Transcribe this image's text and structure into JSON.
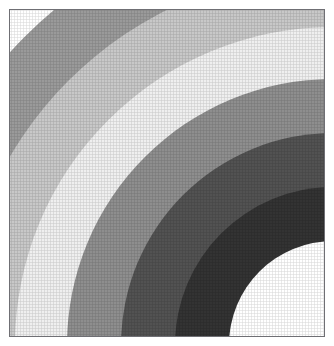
{
  "figure": {
    "title": "",
    "frame": {
      "border_color": "#6f6f74",
      "background_color": "#ffffff",
      "left": 9,
      "top": 9,
      "width": 316,
      "height": 328
    },
    "canvas_background": "#ffffff"
  },
  "chart_data": {
    "type": "pie",
    "title": "",
    "subtitle": "",
    "xlabel": "",
    "ylabel": "",
    "grid": false,
    "legend": "none",
    "center": {
      "x": 323,
      "y": 335,
      "units": "px, relative to frame top-left"
    },
    "angular_extent_deg": 90,
    "categories": [
      "band-1-outer-white",
      "band-2-medium-gray",
      "band-3-light-gray",
      "band-4-near-white",
      "band-5-medium-gray",
      "band-6-dark-gray",
      "band-7-darkest-gray",
      "band-8-inner-white"
    ],
    "series": [
      {
        "name": "inner_radius_px",
        "values": [
          436,
          374,
          318,
          266,
          212,
          158,
          104,
          0
        ]
      },
      {
        "name": "outer_radius_px",
        "values": [
          520,
          436,
          374,
          318,
          266,
          212,
          158,
          104
        ]
      },
      {
        "name": "band_width_px",
        "values": [
          84,
          62,
          56,
          52,
          54,
          54,
          54,
          104
        ]
      },
      {
        "name": "gray_level_0_255",
        "values": [
          255,
          154,
          200,
          239,
          142,
          82,
          51,
          255
        ]
      }
    ],
    "colors": [
      "#ffffff",
      "#9a9a9a",
      "#c8c8c8",
      "#efefef",
      "#8e8e8e",
      "#525252",
      "#333333",
      "#ffffff"
    ],
    "bands": [
      {
        "index": 1,
        "label": "band-1-outer-white",
        "color": "#ffffff",
        "inner_radius": 436,
        "outer_radius": 520
      },
      {
        "index": 2,
        "label": "band-2-medium-gray",
        "color": "#9a9a9a",
        "inner_radius": 374,
        "outer_radius": 436
      },
      {
        "index": 3,
        "label": "band-3-light-gray",
        "color": "#c8c8c8",
        "inner_radius": 318,
        "outer_radius": 374
      },
      {
        "index": 4,
        "label": "band-4-near-white",
        "color": "#efefef",
        "inner_radius": 266,
        "outer_radius": 318
      },
      {
        "index": 5,
        "label": "band-5-medium-gray",
        "color": "#8e8e8e",
        "inner_radius": 212,
        "outer_radius": 266
      },
      {
        "index": 6,
        "label": "band-6-dark-gray",
        "color": "#525252",
        "inner_radius": 158,
        "outer_radius": 212
      },
      {
        "index": 7,
        "label": "band-7-darkest-gray",
        "color": "#333333",
        "inner_radius": 104,
        "outer_radius": 158
      },
      {
        "index": 8,
        "label": "band-8-inner-white",
        "color": "#ffffff",
        "inner_radius": 0,
        "outer_radius": 104
      }
    ],
    "axis_ranges": {
      "xlim": [
        0,
        316
      ],
      "ylim": [
        0,
        328
      ]
    },
    "tick_labels": {
      "x": [],
      "y": []
    },
    "annotations": []
  }
}
